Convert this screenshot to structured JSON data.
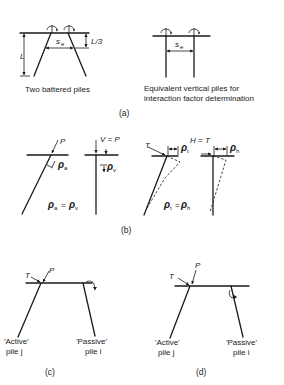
{
  "panel_a": {
    "left_caption": "Two battered piles",
    "right_caption_line1": "Equivalent vertical piles for",
    "right_caption_line2": "interaction  factor determination",
    "dim_L": "L",
    "dim_L3": "L/3",
    "spacing_symbol": "s",
    "spacing_subscript": "e",
    "label": "(a)"
  },
  "panel_b": {
    "load_P": "P",
    "load_V_eq_P": "V = P",
    "rho_a_sub": "a",
    "rho_v_sub": "v",
    "equation_axial": "ρa = ρv",
    "load_T": "T",
    "load_H_eq_T": "H = T",
    "rho_t_sub": "t",
    "rho_h_sub": "h",
    "equation_lateral": "ρt = ρh",
    "rho_symbol": "ρ",
    "equals": "=",
    "label": "(b)"
  },
  "panel_c": {
    "load_T": "T",
    "load_P": "P",
    "active_line1": "'Active'",
    "active_line2": "pile j",
    "passive_line1": "'Passive'",
    "passive_line2": "pile i",
    "label": "(c)"
  },
  "panel_d": {
    "load_T": "T",
    "load_P": "P",
    "active_line1": "'Active'",
    "active_line2": "pile j",
    "passive_line1": "'Passive'",
    "passive_line2": "pile i",
    "label": "(d)"
  }
}
